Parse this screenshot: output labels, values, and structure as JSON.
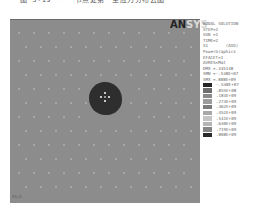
{
  "caption": "图 3-19  ···  节点处第一主应力分布云图",
  "logo": {
    "bold": "AN",
    "rest": "SYS"
  },
  "info_lines": [
    "NODAL SOLUTION",
    "STEP=2",
    "SUB =1",
    "TIME=2",
    "S1       (AVG)",
    "PowerGraphics",
    "EFACET=1",
    "AVRES=Mat",
    "DMX =.335148",
    "SMN =-.538E+07",
    "SMX =.808E+09"
  ],
  "legend": [
    {
      "value": "-.538E+07",
      "color": "#262626"
    },
    {
      "value": ".855E+08",
      "color": "#6e6e6e"
    },
    {
      "value": ".184E+09",
      "color": "#8a8a8a"
    },
    {
      "value": ".273E+09",
      "color": "#9c9c9c"
    },
    {
      "value": ".362E+09",
      "color": "#7c7c7c"
    },
    {
      "value": ".452E+09",
      "color": "#a8a8a8"
    },
    {
      "value": ".541E+09",
      "color": "#c4c4c4"
    },
    {
      "value": ".630E+09",
      "color": "#b4b4b4"
    },
    {
      "value": ".719E+09",
      "color": "#858585"
    },
    {
      "value": ".808E+09",
      "color": "#2a2a2a"
    }
  ],
  "viewport_tag": "S1=2",
  "colors": {
    "background": "#8c8c8c",
    "blob": "#2e2e2e"
  }
}
